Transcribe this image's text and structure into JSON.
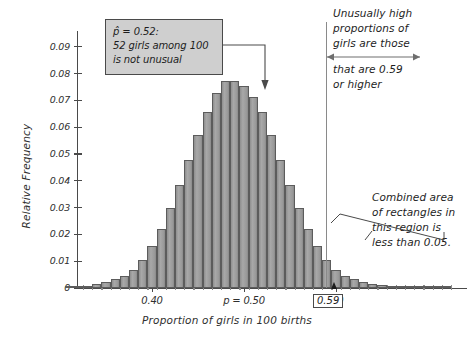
{
  "figure": {
    "xlabel": "Proportion of girls in 100 births",
    "ylabel": "Relative Frequency"
  },
  "callout": {
    "line1": "p̂ = 0.52:",
    "line2": "52 girls among 100",
    "line3": "is not unusual"
  },
  "annotations": {
    "high_line1": "Unusually high",
    "high_line2": "proportions of",
    "high_line3": "girls are those",
    "high_line4": "that are 0.59",
    "high_line5": "or higher",
    "area_line1": "Combined area",
    "area_line2": "of rectangles in",
    "area_line3": "this region is",
    "area_line4": "less than 0.05.",
    "boxed_value": "0.59"
  },
  "chart_data": {
    "type": "bar",
    "title": "",
    "xlabel": "Proportion of girls in 100 births",
    "ylabel": "Relative Frequency",
    "xlim": [
      0.3,
      0.73
    ],
    "ylim": [
      0,
      0.095
    ],
    "grid": false,
    "legend": null,
    "ytick_labels": [
      "0",
      "0.01",
      "0.02",
      "0.03",
      "0.04",
      "0.05",
      "0.06",
      "0.07",
      "0.08",
      "0.09"
    ],
    "ytick_values": [
      0,
      0.01,
      0.02,
      0.03,
      0.04,
      0.05,
      0.06,
      0.07,
      0.08,
      0.09
    ],
    "xtick_labels": [
      "0.40",
      "p = 0.50",
      "0.60"
    ],
    "xtick_values": [
      0.4,
      0.5,
      0.6
    ],
    "bar_width": 0.01,
    "categories": [
      0.31,
      0.32,
      0.33,
      0.34,
      0.35,
      0.36,
      0.37,
      0.38,
      0.39,
      0.4,
      0.41,
      0.42,
      0.43,
      0.44,
      0.45,
      0.46,
      0.47,
      0.48,
      0.49,
      0.5,
      0.51,
      0.52,
      0.53,
      0.54,
      0.55,
      0.56,
      0.57,
      0.58,
      0.59,
      0.6,
      0.61,
      0.62,
      0.63,
      0.64,
      0.65,
      0.66,
      0.67,
      0.68,
      0.69,
      0.7,
      0.71,
      0.72
    ],
    "values": [
      0.0003,
      0.0005,
      0.0008,
      0.0014,
      0.0023,
      0.0035,
      0.0046,
      0.0069,
      0.0105,
      0.0156,
      0.0222,
      0.0298,
      0.0385,
      0.0478,
      0.0571,
      0.0657,
      0.0727,
      0.0774,
      0.0774,
      0.0753,
      0.0713,
      0.0657,
      0.0571,
      0.0478,
      0.0385,
      0.0298,
      0.0222,
      0.0156,
      0.0105,
      0.0069,
      0.0046,
      0.0035,
      0.0023,
      0.0014,
      0.001,
      0.0008,
      0.0006,
      0.0005,
      0.0004,
      0.0003,
      0.0002,
      0.0002
    ],
    "marker_lines": [
      {
        "x": 0.59,
        "label": "0.59"
      }
    ],
    "pointer_arrow_x": 0.52
  }
}
